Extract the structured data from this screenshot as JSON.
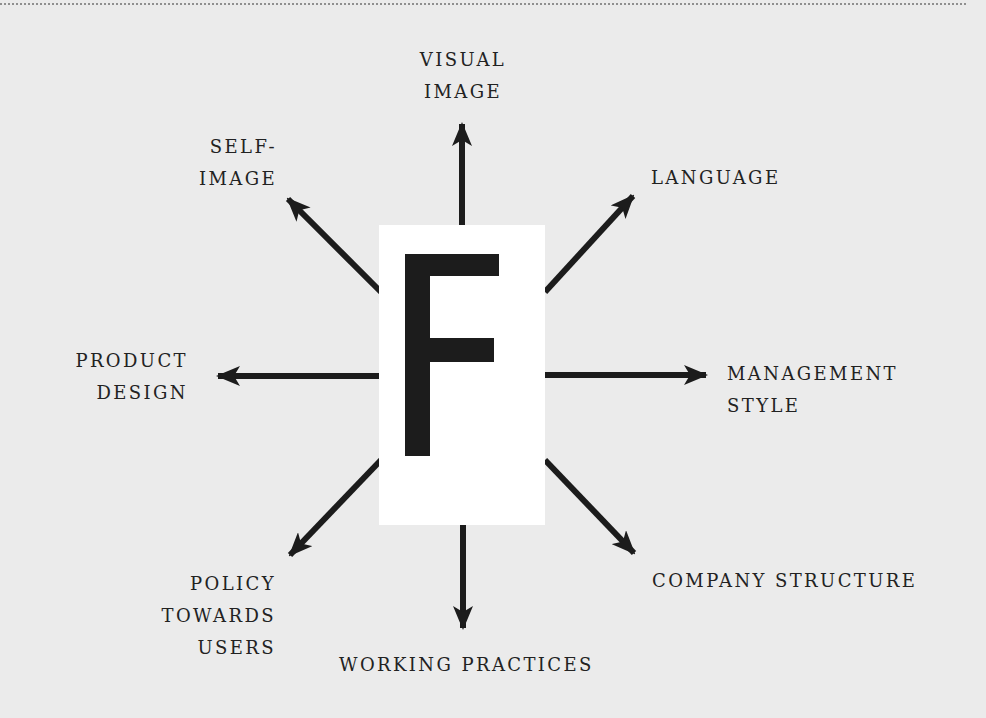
{
  "diagram": {
    "center": {
      "letter": "F"
    },
    "labels": {
      "visual_image": "VISUAL\nIMAGE",
      "self_image": "SELF-\nIMAGE",
      "language": "LANGUAGE",
      "product_design": "PRODUCT\nDESIGN",
      "management_style": "MANAGEMENT\nSTYLE",
      "policy_towards_users": "POLICY\nTOWARDS\nUSERS",
      "working_practices": "WORKING PRACTICES",
      "company_structure": "COMPANY STRUCTURE"
    },
    "colors": {
      "background": "#ebebeb",
      "arrow": "#1c1c1c",
      "text": "#222222",
      "center_box": "#ffffff"
    }
  }
}
